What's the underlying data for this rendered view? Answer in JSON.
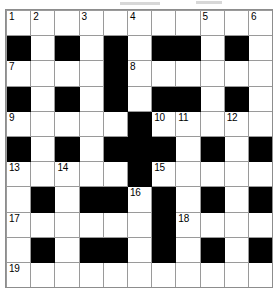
{
  "puzzle": {
    "type": "crossword-grid",
    "title": "Crossword Puzzle Grid",
    "columns": 11,
    "rows": 11,
    "colors": {
      "block": "#000000",
      "empty": "#ffffff",
      "gridline": "#9a9a9a",
      "number": "#000000"
    },
    "cells": [
      [
        {
          "block": false,
          "num": "1"
        },
        {
          "block": false,
          "num": "2"
        },
        {
          "block": false,
          "num": ""
        },
        {
          "block": false,
          "num": "3"
        },
        {
          "block": false,
          "num": ""
        },
        {
          "block": false,
          "num": "4"
        },
        {
          "block": false,
          "num": ""
        },
        {
          "block": false,
          "num": ""
        },
        {
          "block": false,
          "num": "5"
        },
        {
          "block": false,
          "num": ""
        },
        {
          "block": false,
          "num": "6"
        }
      ],
      [
        {
          "block": true,
          "num": ""
        },
        {
          "block": false,
          "num": ""
        },
        {
          "block": true,
          "num": ""
        },
        {
          "block": false,
          "num": ""
        },
        {
          "block": true,
          "num": ""
        },
        {
          "block": false,
          "num": ""
        },
        {
          "block": true,
          "num": ""
        },
        {
          "block": true,
          "num": ""
        },
        {
          "block": false,
          "num": ""
        },
        {
          "block": true,
          "num": ""
        },
        {
          "block": false,
          "num": ""
        }
      ],
      [
        {
          "block": false,
          "num": "7"
        },
        {
          "block": false,
          "num": ""
        },
        {
          "block": false,
          "num": ""
        },
        {
          "block": false,
          "num": ""
        },
        {
          "block": true,
          "num": ""
        },
        {
          "block": false,
          "num": "8"
        },
        {
          "block": false,
          "num": ""
        },
        {
          "block": false,
          "num": ""
        },
        {
          "block": false,
          "num": ""
        },
        {
          "block": false,
          "num": ""
        },
        {
          "block": false,
          "num": ""
        }
      ],
      [
        {
          "block": true,
          "num": ""
        },
        {
          "block": false,
          "num": ""
        },
        {
          "block": true,
          "num": ""
        },
        {
          "block": false,
          "num": ""
        },
        {
          "block": true,
          "num": ""
        },
        {
          "block": false,
          "num": ""
        },
        {
          "block": true,
          "num": ""
        },
        {
          "block": true,
          "num": ""
        },
        {
          "block": false,
          "num": ""
        },
        {
          "block": true,
          "num": ""
        },
        {
          "block": false,
          "num": ""
        }
      ],
      [
        {
          "block": false,
          "num": "9"
        },
        {
          "block": false,
          "num": ""
        },
        {
          "block": false,
          "num": ""
        },
        {
          "block": false,
          "num": ""
        },
        {
          "block": false,
          "num": ""
        },
        {
          "block": true,
          "num": ""
        },
        {
          "block": false,
          "num": "10"
        },
        {
          "block": false,
          "num": "11"
        },
        {
          "block": false,
          "num": ""
        },
        {
          "block": false,
          "num": "12"
        },
        {
          "block": false,
          "num": ""
        }
      ],
      [
        {
          "block": true,
          "num": ""
        },
        {
          "block": false,
          "num": ""
        },
        {
          "block": true,
          "num": ""
        },
        {
          "block": false,
          "num": ""
        },
        {
          "block": true,
          "num": ""
        },
        {
          "block": true,
          "num": ""
        },
        {
          "block": true,
          "num": ""
        },
        {
          "block": false,
          "num": ""
        },
        {
          "block": true,
          "num": ""
        },
        {
          "block": false,
          "num": ""
        },
        {
          "block": true,
          "num": ""
        }
      ],
      [
        {
          "block": false,
          "num": "13"
        },
        {
          "block": false,
          "num": ""
        },
        {
          "block": false,
          "num": "14"
        },
        {
          "block": false,
          "num": ""
        },
        {
          "block": false,
          "num": ""
        },
        {
          "block": true,
          "num": ""
        },
        {
          "block": false,
          "num": "15"
        },
        {
          "block": false,
          "num": ""
        },
        {
          "block": false,
          "num": ""
        },
        {
          "block": false,
          "num": ""
        },
        {
          "block": false,
          "num": ""
        }
      ],
      [
        {
          "block": false,
          "num": ""
        },
        {
          "block": true,
          "num": ""
        },
        {
          "block": false,
          "num": ""
        },
        {
          "block": true,
          "num": ""
        },
        {
          "block": true,
          "num": ""
        },
        {
          "block": false,
          "num": "16"
        },
        {
          "block": true,
          "num": ""
        },
        {
          "block": false,
          "num": ""
        },
        {
          "block": true,
          "num": ""
        },
        {
          "block": false,
          "num": ""
        },
        {
          "block": true,
          "num": ""
        }
      ],
      [
        {
          "block": false,
          "num": "17"
        },
        {
          "block": false,
          "num": ""
        },
        {
          "block": false,
          "num": ""
        },
        {
          "block": false,
          "num": ""
        },
        {
          "block": false,
          "num": ""
        },
        {
          "block": false,
          "num": ""
        },
        {
          "block": true,
          "num": ""
        },
        {
          "block": false,
          "num": "18"
        },
        {
          "block": false,
          "num": ""
        },
        {
          "block": false,
          "num": ""
        },
        {
          "block": false,
          "num": ""
        }
      ],
      [
        {
          "block": false,
          "num": ""
        },
        {
          "block": true,
          "num": ""
        },
        {
          "block": false,
          "num": ""
        },
        {
          "block": true,
          "num": ""
        },
        {
          "block": true,
          "num": ""
        },
        {
          "block": false,
          "num": ""
        },
        {
          "block": true,
          "num": ""
        },
        {
          "block": false,
          "num": ""
        },
        {
          "block": true,
          "num": ""
        },
        {
          "block": false,
          "num": ""
        },
        {
          "block": true,
          "num": ""
        }
      ],
      [
        {
          "block": false,
          "num": "19"
        },
        {
          "block": false,
          "num": ""
        },
        {
          "block": false,
          "num": ""
        },
        {
          "block": false,
          "num": ""
        },
        {
          "block": false,
          "num": ""
        },
        {
          "block": false,
          "num": ""
        },
        {
          "block": false,
          "num": ""
        },
        {
          "block": false,
          "num": ""
        },
        {
          "block": false,
          "num": ""
        },
        {
          "block": false,
          "num": ""
        },
        {
          "block": false,
          "num": ""
        }
      ]
    ]
  }
}
